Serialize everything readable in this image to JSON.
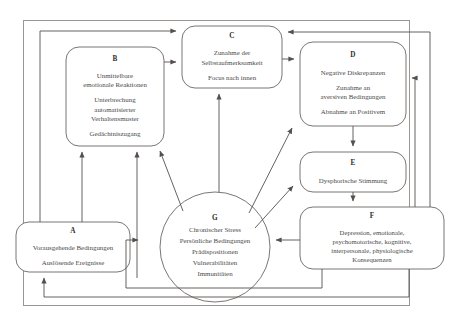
{
  "diagram": {
    "outer_frame": {
      "present": true,
      "color": "#8a8a8a"
    },
    "line_color": "#55504e",
    "node_border_color": "#6b6663",
    "text_color": "#3f3b39",
    "nodes": [
      {
        "id": "A",
        "name": "node-a",
        "shape": "rounded-rect",
        "paragraphs": [
          [
            "Vorausgehende Bedingungen"
          ],
          [
            "Auslösende Ereignisse"
          ]
        ]
      },
      {
        "id": "B",
        "name": "node-b",
        "shape": "rounded-rect",
        "paragraphs": [
          [
            "Unmittelbare",
            "emotionale Reaktionen"
          ],
          [
            "Unterbrechung",
            "automatisierter",
            "Verhaltensmuster"
          ],
          [
            "Gedächtniszugang"
          ]
        ]
      },
      {
        "id": "C",
        "name": "node-c",
        "shape": "rounded-rect",
        "paragraphs": [
          [
            "Zunahme der",
            "Selbstaufmerksamkeit"
          ],
          [
            "Focus nach innen"
          ]
        ]
      },
      {
        "id": "D",
        "name": "node-d",
        "shape": "rounded-rect",
        "paragraphs": [
          [
            "Negative Diskrepanzen"
          ],
          [
            "Zunahme an",
            "aversiven Bedingungen"
          ],
          [
            "Abnahme an Positivem"
          ]
        ]
      },
      {
        "id": "E",
        "name": "node-e",
        "shape": "rounded-rect",
        "paragraphs": [
          [
            "Dysphorische Stimmung"
          ]
        ]
      },
      {
        "id": "F",
        "name": "node-f",
        "shape": "rounded-rect",
        "paragraphs": [
          [
            "Depression, emotionale,",
            "psychomotorische, kognitive,",
            "interpersonale, physiologische",
            "Konsequenzen"
          ]
        ]
      },
      {
        "id": "G",
        "name": "node-g",
        "shape": "circle",
        "paragraphs": [
          [
            "Chronischer Stress",
            "Persönliche Bedingungen",
            "Prädispositionen",
            "Vulnerabilitäten",
            "Immunitäten"
          ]
        ]
      }
    ],
    "edges": [
      {
        "from": "A",
        "to": "B",
        "style": "straight-up"
      },
      {
        "from": "A",
        "to": "B",
        "style": "straight-up-second"
      },
      {
        "from": "A",
        "to": "C",
        "style": "left-elbow-up"
      },
      {
        "from": "B",
        "to": "C",
        "style": "right-elbow"
      },
      {
        "from": "C",
        "to": "D",
        "style": "straight-right"
      },
      {
        "from": "D",
        "to": "E",
        "style": "straight-down"
      },
      {
        "from": "E",
        "to": "F",
        "style": "straight-down"
      },
      {
        "from": "F",
        "to": "G",
        "style": "straight-left"
      },
      {
        "from": "F",
        "to": "C",
        "style": "right-elbow-up-over-d"
      },
      {
        "from": "F",
        "to": "D",
        "style": "right-elbow-up"
      },
      {
        "from": "F",
        "to": "A",
        "style": "bottom-elbow-left"
      },
      {
        "from": "G",
        "to": "A",
        "style": "bottom-elbow-left-inner"
      },
      {
        "from": "G",
        "to": "B",
        "style": "diagonal-up-left"
      },
      {
        "from": "G",
        "to": "C",
        "style": "straight-up"
      },
      {
        "from": "G",
        "to": "D",
        "style": "diagonal-up-right"
      },
      {
        "from": "G",
        "to": "E",
        "style": "diagonal-up-right-short"
      }
    ]
  }
}
